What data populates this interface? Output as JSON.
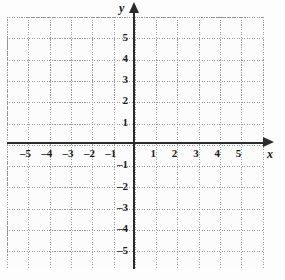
{
  "figure": {
    "kind": "cartesian-coordinate-grid",
    "background_color": "#fdfdfd",
    "axis_color": "#2b2b2b",
    "grid_color": "#9a9a9a",
    "label_color": "#1a1a1a"
  },
  "axes": {
    "x_axis_label": "x",
    "y_axis_label": "y",
    "x_arrow": "arrow-right",
    "y_arrow": "arrow-up"
  },
  "chart_data": {
    "type": "scatter",
    "title": "",
    "subtitle": "",
    "xlabel": "x",
    "ylabel": "y",
    "xlim": [
      -6,
      6
    ],
    "ylim": [
      -6,
      6
    ],
    "xticks": [
      -5,
      -4,
      -3,
      -2,
      -1,
      1,
      2,
      3,
      4,
      5
    ],
    "yticks": [
      5,
      4,
      3,
      2,
      1,
      -1,
      -2,
      -3,
      -4,
      -5
    ],
    "xtick_labels": [
      "–5",
      "–4",
      "–3",
      "–2",
      "–1",
      "1",
      "2",
      "3",
      "4",
      "5"
    ],
    "ytick_labels": [
      "5",
      "4",
      "3",
      "2",
      "1",
      "–1",
      "–2",
      "–3",
      "–4",
      "–5"
    ],
    "grid": true,
    "grid_style": "dotted",
    "grid_step": 1,
    "legend": null,
    "series": [],
    "values": [],
    "annotations": []
  },
  "x_tick_labels": [
    {
      "value": -5,
      "label": "–5"
    },
    {
      "value": -4,
      "label": "–4"
    },
    {
      "value": -3,
      "label": "–3"
    },
    {
      "value": -2,
      "label": "–2"
    },
    {
      "value": -1,
      "label": "–1"
    },
    {
      "value": 1,
      "label": "1"
    },
    {
      "value": 2,
      "label": "2"
    },
    {
      "value": 3,
      "label": "3"
    },
    {
      "value": 4,
      "label": "4"
    },
    {
      "value": 5,
      "label": "5"
    }
  ],
  "y_tick_labels": [
    {
      "value": 5,
      "label": "5"
    },
    {
      "value": 4,
      "label": "4"
    },
    {
      "value": 3,
      "label": "3"
    },
    {
      "value": 2,
      "label": "2"
    },
    {
      "value": 1,
      "label": "1"
    },
    {
      "value": -1,
      "label": "–1"
    },
    {
      "value": -2,
      "label": "–2"
    },
    {
      "value": -3,
      "label": "–3"
    },
    {
      "value": -4,
      "label": "–4"
    },
    {
      "value": -5,
      "label": "–5"
    }
  ]
}
